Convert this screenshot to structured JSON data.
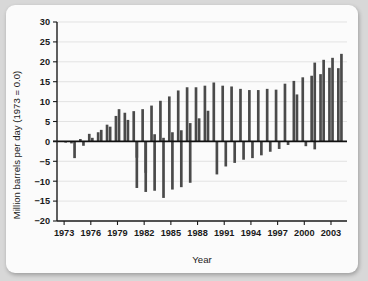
{
  "chart_data": {
    "type": "bar",
    "title": "",
    "subtitle": "",
    "xlabel": "Year",
    "ylabel": "Million barrels per day (1973 = 0.0)",
    "ylim": [
      -20,
      30
    ],
    "xlim": [
      1972.2,
      2004.8
    ],
    "ytick_labels": [
      "30",
      "25",
      "20",
      "15",
      "10",
      "5",
      "0",
      "-5",
      "-10",
      "-15",
      "-20"
    ],
    "ytick_values": [
      30,
      25,
      20,
      15,
      10,
      5,
      0,
      -5,
      -10,
      -15,
      -20
    ],
    "xtick_labels": [
      "1973",
      "1976",
      "1979",
      "1982",
      "1985",
      "1988",
      "1991",
      "1994",
      "1997",
      "2000",
      "2003"
    ],
    "xtick_values": [
      1973,
      1976,
      1979,
      1982,
      1985,
      1988,
      1991,
      1994,
      1997,
      2000,
      2003
    ],
    "grid": "horizontal",
    "legend": "none",
    "bar_color": "#4a4a4a",
    "categories": [
      1973,
      1974,
      1975,
      1976,
      1977,
      1978,
      1979,
      1980,
      1981,
      1982,
      1983,
      1984,
      1985,
      1986,
      1987,
      1988,
      1989,
      1990,
      1991,
      1992,
      1993,
      1994,
      1995,
      1996,
      1997,
      1998,
      1999,
      2000,
      2001,
      2002,
      2003,
      2004
    ],
    "series": [
      {
        "name": "positive",
        "values": [
          0.0,
          -0.5,
          0.6,
          1.9,
          2.3,
          4.2,
          6.4,
          7.2,
          7.6,
          8.1,
          9.0,
          10.2,
          11.3,
          12.8,
          13.6,
          13.6,
          14.0,
          14.8,
          14.0,
          13.8,
          13.2,
          12.9,
          12.9,
          13.2,
          13.0,
          14.5,
          15.2,
          16.1,
          16.5,
          16.9,
          18.5,
          18.4
        ]
      },
      {
        "name": "negative",
        "values": [
          -0.3,
          -4.2,
          -1.1,
          0.9,
          2.9,
          3.7,
          8.1,
          5.4,
          -4.1,
          -7.9,
          1.8,
          0.9,
          2.3,
          2.8,
          4.6,
          5.8,
          7.7,
          -8.3,
          -6.3,
          -5.4,
          -4.6,
          -4.2,
          -3.5,
          -2.6,
          -1.9,
          -0.9,
          11.8,
          -1.2,
          19.8,
          20.5,
          21.0,
          22.0
        ]
      },
      {
        "name": "deep-negative",
        "values": [
          0,
          0,
          0,
          0,
          0,
          0,
          0,
          0,
          -11.7,
          -12.7,
          -12.4,
          -14.2,
          -12.1,
          -11.5,
          -10.4,
          0,
          0,
          0,
          0,
          0,
          0,
          0,
          0,
          0,
          0,
          0,
          0,
          0,
          -2.0,
          0,
          0,
          0
        ]
      }
    ]
  }
}
